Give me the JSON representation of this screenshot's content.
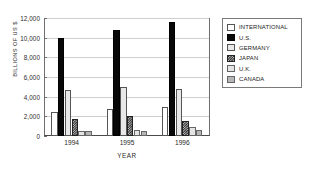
{
  "chart_data": {
    "type": "bar",
    "title": "",
    "xlabel": "YEAR",
    "ylabel": "BILLIONS OF US $",
    "ylim": [
      0,
      12000
    ],
    "yticks": [
      0,
      2000,
      4000,
      6000,
      8000,
      10000,
      12000
    ],
    "ytick_labels": [
      "0",
      "2,000",
      "4,000",
      "6,000",
      "8,000",
      "10,000",
      "12,000"
    ],
    "categories": [
      "1994",
      "1995",
      "1996"
    ],
    "grid": true,
    "legend_position": "right",
    "series": [
      {
        "name": "INTERNATIONAL",
        "swatch": "sw-international",
        "color": "#ffffff",
        "values": [
          2400,
          2750,
          3000
        ]
      },
      {
        "name": "U.S.",
        "swatch": "sw-us",
        "color": "#080808",
        "values": [
          10000,
          10800,
          11600
        ]
      },
      {
        "name": "GERMANY",
        "swatch": "sw-germany",
        "color": "#e8e8e8",
        "values": [
          4700,
          4950,
          4800
        ]
      },
      {
        "name": "JAPAN",
        "swatch": "sw-japan",
        "color": "#2e2e2e",
        "values": [
          1700,
          2050,
          1500
        ]
      },
      {
        "name": "U.K.",
        "swatch": "sw-uk",
        "color": "#e4e4e4",
        "values": [
          550,
          600,
          900
        ]
      },
      {
        "name": "CANADA",
        "swatch": "sw-canada",
        "color": "#b6b6b6",
        "values": [
          520,
          560,
          620
        ]
      }
    ]
  }
}
